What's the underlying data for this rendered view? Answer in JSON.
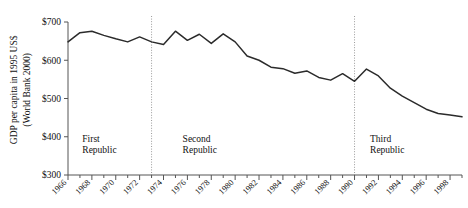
{
  "chart_data": {
    "type": "line",
    "title": "",
    "subtitle": "",
    "xlabel": "",
    "ylabel": "GDP per capita in 1995 US$",
    "ylabel_line2": "(World Bank 2000)",
    "ylim": [
      300,
      700
    ],
    "xlim": [
      1966,
      1999
    ],
    "y_ticks": [
      300,
      400,
      500,
      600,
      700
    ],
    "y_tick_labels": [
      "$300",
      "$400",
      "$500",
      "$600",
      "$700"
    ],
    "x_ticks": [
      1966,
      1968,
      1970,
      1972,
      1974,
      1976,
      1978,
      1980,
      1982,
      1984,
      1986,
      1988,
      1990,
      1992,
      1994,
      1996,
      1998
    ],
    "x_tick_labels": [
      "1966",
      "1968",
      "1970",
      "1972",
      "1974",
      "1976",
      "1978",
      "1980",
      "1982",
      "1984",
      "1986",
      "1988",
      "1990",
      "1992",
      "1994",
      "1996",
      "1998"
    ],
    "x_minor_ticks": [
      1967,
      1969,
      1971,
      1973,
      1975,
      1977,
      1979,
      1981,
      1983,
      1985,
      1987,
      1989,
      1991,
      1993,
      1995,
      1997,
      1999
    ],
    "grid": false,
    "legend": "none",
    "line_color": "#2b2b2b",
    "axis_color": "#555555",
    "divider_color": "#9a9a9a",
    "x": [
      1966,
      1967,
      1968,
      1969,
      1970,
      1971,
      1972,
      1973,
      1974,
      1975,
      1976,
      1977,
      1978,
      1979,
      1980,
      1981,
      1982,
      1983,
      1984,
      1985,
      1986,
      1987,
      1988,
      1989,
      1990,
      1991,
      1992,
      1993,
      1994,
      1995,
      1996,
      1997,
      1998,
      1999
    ],
    "values": [
      648,
      672,
      676,
      665,
      656,
      648,
      661,
      648,
      641,
      676,
      652,
      668,
      644,
      669,
      648,
      611,
      600,
      582,
      578,
      566,
      572,
      555,
      548,
      565,
      545,
      577,
      559,
      527,
      506,
      489,
      472,
      461,
      457,
      452
    ],
    "series": [
      {
        "name": "GDP per capita (1995 US$)",
        "values": [
          648,
          672,
          676,
          665,
          656,
          648,
          661,
          648,
          641,
          676,
          652,
          668,
          644,
          669,
          648,
          611,
          600,
          582,
          578,
          566,
          572,
          555,
          548,
          565,
          545,
          577,
          559,
          527,
          506,
          489,
          472,
          461,
          457,
          452
        ]
      }
    ],
    "annotations": [
      {
        "label_line1": "First",
        "label_line2": "Republic",
        "x": 1967.2,
        "y": 385
      },
      {
        "label_line1": "Second",
        "label_line2": "Republic",
        "x": 1975.6,
        "y": 385
      },
      {
        "label_line1": "Third",
        "label_line2": "Republic",
        "x": 1991.3,
        "y": 385
      }
    ],
    "dividers": [
      {
        "name": "first-second-divider",
        "x": 1973.0
      },
      {
        "name": "second-third-divider",
        "x": 1990.0
      }
    ]
  }
}
